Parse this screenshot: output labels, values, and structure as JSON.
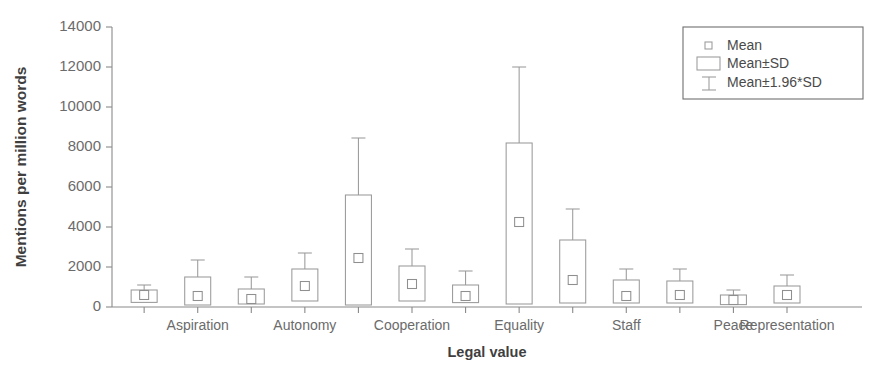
{
  "chart_data": {
    "type": "bar",
    "title": "",
    "xlabel": "Legal value",
    "ylabel": "Mentions per million words",
    "ylim": [
      0,
      14000
    ],
    "yticks": [
      0,
      2000,
      4000,
      6000,
      8000,
      10000,
      12000,
      14000
    ],
    "ytick_labels": [
      "0",
      "2000",
      "4000",
      "6000",
      "8000",
      "10000",
      "12000",
      "14000"
    ],
    "grid": false,
    "legend_position": "top-right",
    "legend": [
      {
        "label": "Mean",
        "marker": "small-square"
      },
      {
        "label": "Mean±SD",
        "marker": "box"
      },
      {
        "label": "Mean±1.96*SD",
        "marker": "whisker"
      }
    ],
    "xtick_labels_visible": [
      "Aspiration",
      "Autonomy",
      "Cooperation",
      "Equality",
      "Staff",
      "Peace",
      "Representation"
    ],
    "categories": [
      "cat-1",
      "Aspiration",
      "cat-3",
      "Autonomy",
      "cat-5",
      "Cooperation",
      "cat-7",
      "Equality",
      "cat-9",
      "Staff",
      "cat-11",
      "Peace",
      "cat-13"
    ],
    "series": [
      {
        "name": "Mean",
        "values": [
          0,
          600,
          550,
          400,
          1050,
          2450,
          1150,
          550,
          4250,
          1350,
          550,
          600,
          350
        ]
      },
      {
        "name": "Mean±SD lower",
        "values": [
          0,
          230,
          100,
          150,
          300,
          100,
          300,
          220,
          150,
          200,
          200,
          200,
          120
        ]
      },
      {
        "name": "Mean±SD upper",
        "values": [
          0,
          850,
          1500,
          900,
          1900,
          5600,
          2050,
          1100,
          8200,
          3350,
          1350,
          1300,
          600
        ]
      },
      {
        "name": "Mean±1.96*SD upper",
        "values": [
          0,
          1100,
          2350,
          1500,
          2700,
          8450,
          2900,
          1800,
          12000,
          4900,
          1900,
          1900,
          850
        ]
      }
    ],
    "boxes": [
      {
        "index": 1,
        "label": "Aspiration-pre",
        "mean": 600,
        "sd_low": 230,
        "sd_high": 850,
        "ci_high": 1100,
        "visible_label": ""
      },
      {
        "index": 2,
        "label": "Aspiration",
        "mean": 550,
        "sd_low": 100,
        "sd_high": 1500,
        "ci_high": 2350,
        "visible_label": "Aspiration"
      },
      {
        "index": 3,
        "label": "Autonomy-pre",
        "mean": 400,
        "sd_low": 150,
        "sd_high": 900,
        "ci_high": 1500,
        "visible_label": ""
      },
      {
        "index": 4,
        "label": "Autonomy",
        "mean": 1050,
        "sd_low": 300,
        "sd_high": 1900,
        "ci_high": 2700,
        "visible_label": "Autonomy"
      },
      {
        "index": 5,
        "label": "Cooperation-pre",
        "mean": 2450,
        "sd_low": 100,
        "sd_high": 5600,
        "ci_high": 8450,
        "visible_label": ""
      },
      {
        "index": 6,
        "label": "Cooperation",
        "mean": 1150,
        "sd_low": 300,
        "sd_high": 2050,
        "ci_high": 2900,
        "visible_label": "Cooperation"
      },
      {
        "index": 7,
        "label": "Equality-pre",
        "mean": 550,
        "sd_low": 220,
        "sd_high": 1100,
        "ci_high": 1800,
        "visible_label": ""
      },
      {
        "index": 8,
        "label": "Equality",
        "mean": 4250,
        "sd_low": 150,
        "sd_high": 8200,
        "ci_high": 12000,
        "visible_label": "Equality"
      },
      {
        "index": 9,
        "label": "Staff-pre",
        "mean": 1350,
        "sd_low": 200,
        "sd_high": 3350,
        "ci_high": 4900,
        "visible_label": ""
      },
      {
        "index": 10,
        "label": "Staff",
        "mean": 550,
        "sd_low": 200,
        "sd_high": 1350,
        "ci_high": 1900,
        "visible_label": "Staff"
      },
      {
        "index": 11,
        "label": "Peace-pre",
        "mean": 600,
        "sd_low": 200,
        "sd_high": 1300,
        "ci_high": 1900,
        "visible_label": ""
      },
      {
        "index": 12,
        "label": "Peace",
        "mean": 350,
        "sd_low": 120,
        "sd_high": 600,
        "ci_high": 850,
        "visible_label": "Peace"
      },
      {
        "index": 13,
        "label": "Representation",
        "mean": 600,
        "sd_low": 200,
        "sd_high": 1050,
        "ci_high": 1600,
        "visible_label": "Representation"
      }
    ]
  },
  "colors": {
    "stroke": "#9a9a9a",
    "axis": "#8a8a8a",
    "text": "#5d5d5d",
    "background": "#ffffff"
  }
}
